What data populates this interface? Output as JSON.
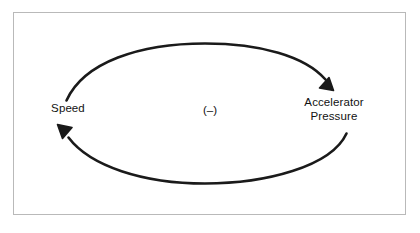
{
  "diagram": {
    "type": "causal-loop-diagram",
    "title": "",
    "background_color": "#ffffff",
    "frame": {
      "border_color": "#b9b9b9",
      "fill": "#ffffff"
    },
    "stroke_color": "#1a1a1a",
    "nodes": [
      {
        "id": "speed",
        "label": "Speed",
        "position": "left"
      },
      {
        "id": "accelerator-pressure",
        "label": "Accelerator\nPressure",
        "position": "right"
      }
    ],
    "links": [
      {
        "id": "speed-to-accelerator",
        "from": "speed",
        "to": "accelerator-pressure",
        "path": "top-arc",
        "arrowhead": "filled-triangle",
        "direction": "clockwise"
      },
      {
        "id": "accelerator-to-speed",
        "from": "accelerator-pressure",
        "to": "speed",
        "path": "bottom-arc",
        "arrowhead": "filled-triangle",
        "direction": "clockwise"
      }
    ],
    "polarity": {
      "label": "(–)",
      "meaning": "balancing-loop"
    }
  }
}
